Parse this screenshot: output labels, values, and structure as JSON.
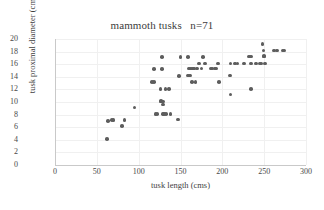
{
  "chart_data": {
    "type": "scatter",
    "title": "mammoth tusks   n=71",
    "xlabel": "tusk length (cms)",
    "ylabel": "tusk proximal diameter (cms)",
    "xlim": [
      0,
      300
    ],
    "ylim": [
      0,
      20
    ],
    "xticks": [
      0,
      50,
      100,
      150,
      200,
      250,
      300
    ],
    "yticks": [
      0,
      2,
      4,
      6,
      8,
      10,
      12,
      14,
      16,
      18,
      20
    ],
    "grid": true,
    "legend": false,
    "legend_position": "none",
    "marker_color": "#5d5d5d",
    "n": 71,
    "series": [
      {
        "name": "mammoth tusks",
        "points": [
          [
            62,
            4.1
          ],
          [
            63,
            7.0
          ],
          [
            68,
            7.1
          ],
          [
            70,
            7.1
          ],
          [
            80,
            6.2
          ],
          [
            83,
            7.1
          ],
          [
            95,
            9.1
          ],
          [
            116,
            13.2
          ],
          [
            118,
            13.2
          ],
          [
            118,
            15.2
          ],
          [
            120,
            8.1
          ],
          [
            122,
            8.1
          ],
          [
            126,
            12.1
          ],
          [
            127,
            10.1
          ],
          [
            127,
            10.2
          ],
          [
            128,
            15.2
          ],
          [
            128,
            17.1
          ],
          [
            129,
            10.1
          ],
          [
            129,
            9.6
          ],
          [
            129,
            8.1
          ],
          [
            130,
            8.1
          ],
          [
            132,
            12.1
          ],
          [
            136,
            12.1
          ],
          [
            138,
            8.1
          ],
          [
            147,
            7.2
          ],
          [
            148,
            14.1
          ],
          [
            150,
            17.1
          ],
          [
            159,
            17.1
          ],
          [
            159,
            14.2
          ],
          [
            160,
            15.3
          ],
          [
            161,
            14.2
          ],
          [
            162,
            15.3
          ],
          [
            164,
            13.2
          ],
          [
            165,
            15.3
          ],
          [
            166,
            15.3
          ],
          [
            168,
            13.2
          ],
          [
            170,
            15.3
          ],
          [
            172,
            16.1
          ],
          [
            175,
            15.3
          ],
          [
            177,
            17.1
          ],
          [
            179,
            16.1
          ],
          [
            188,
            15.3
          ],
          [
            191,
            15.3
          ],
          [
            193,
            15.3
          ],
          [
            195,
            16.1
          ],
          [
            196,
            13.2
          ],
          [
            209,
            14.2
          ],
          [
            210,
            16.1
          ],
          [
            210,
            11.2
          ],
          [
            215,
            16.1
          ],
          [
            218,
            16.1
          ],
          [
            232,
            17.2
          ],
          [
            234,
            17.2
          ],
          [
            234,
            16.1
          ],
          [
            234,
            12.1
          ],
          [
            240,
            16.1
          ],
          [
            245,
            16.1
          ],
          [
            247,
            16.1
          ],
          [
            248,
            19.2
          ],
          [
            249,
            18.2
          ],
          [
            250,
            17.3
          ],
          [
            250,
            17.2
          ],
          [
            251,
            16.1
          ],
          [
            262,
            18.2
          ],
          [
            265,
            18.2
          ],
          [
            272,
            18.2
          ],
          [
            274,
            18.2
          ],
          [
            226,
            16.1
          ],
          [
            186,
            15.3
          ],
          [
            163,
            15.3
          ],
          [
            133,
            8.1
          ]
        ]
      }
    ]
  }
}
